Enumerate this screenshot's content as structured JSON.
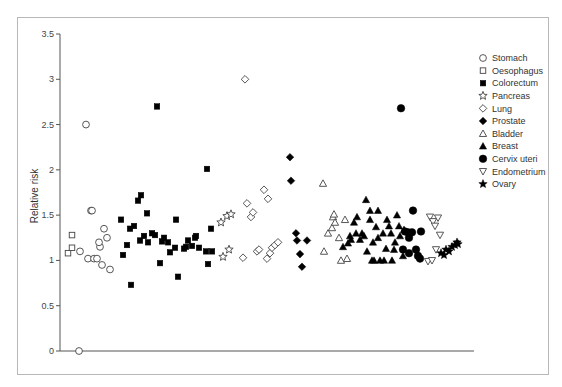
{
  "chart_data": {
    "type": "scatter",
    "title": "",
    "xlabel": "",
    "ylabel": "Relative risk",
    "ylim": [
      0,
      3.5
    ],
    "yticks": [
      0,
      0.5,
      1,
      1.5,
      2,
      2.5,
      3,
      3.5
    ],
    "ytick_labels": [
      "0",
      "0.5",
      "1",
      "1.5",
      "2",
      "2.5",
      "3",
      "3.5"
    ],
    "grid": false,
    "legend_position": "right",
    "series": [
      {
        "name": "Stomach",
        "marker": "circle-open",
        "x": [
          86,
          80,
          91,
          92,
          88,
          94,
          97,
          100,
          99,
          107,
          104,
          102,
          110,
          79
        ],
        "values": [
          2.5,
          1.1,
          1.55,
          1.55,
          1.02,
          1.02,
          1.02,
          1.15,
          1.2,
          1.25,
          1.35,
          0.95,
          0.9,
          0.0
        ]
      },
      {
        "name": "Oesophagus",
        "marker": "square-open",
        "x": [
          68,
          72,
          72
        ],
        "values": [
          1.08,
          1.14,
          1.28
        ]
      },
      {
        "name": "Colorectum",
        "marker": "square-filled",
        "x": [
          121,
          123,
          127,
          130,
          134,
          138,
          141,
          147,
          148,
          140,
          144,
          131,
          152,
          155,
          157,
          164,
          160,
          168,
          170,
          176,
          175,
          178,
          184,
          188,
          192,
          186,
          195,
          199,
          206,
          208,
          162,
          211,
          207,
          196,
          212
        ],
        "values": [
          1.45,
          1.06,
          1.17,
          1.35,
          1.38,
          1.66,
          1.72,
          1.52,
          1.2,
          1.22,
          1.27,
          0.73,
          1.3,
          1.28,
          2.7,
          1.25,
          0.97,
          1.2,
          1.09,
          1.45,
          1.14,
          0.82,
          1.13,
          1.22,
          1.16,
          1.15,
          1.25,
          1.14,
          1.1,
          0.96,
          1.21,
          1.35,
          2.01,
          1.27,
          1.1
        ]
      },
      {
        "name": "Pancreas",
        "marker": "star-open",
        "x": [
          221,
          223,
          227,
          229,
          231
        ],
        "values": [
          1.42,
          1.04,
          1.49,
          1.12,
          1.51
        ]
      },
      {
        "name": "Lung",
        "marker": "diamond-open",
        "x": [
          245,
          247,
          251,
          253,
          257,
          259,
          264,
          267,
          270,
          272,
          275,
          278,
          243,
          268
        ],
        "values": [
          3.0,
          1.63,
          1.48,
          1.53,
          1.1,
          1.12,
          1.78,
          1.02,
          1.08,
          1.14,
          1.17,
          1.2,
          1.03,
          1.68
        ]
      },
      {
        "name": "Prostate",
        "marker": "diamond-filled",
        "x": [
          290,
          291,
          296,
          297,
          300,
          302,
          307
        ],
        "values": [
          2.14,
          1.88,
          1.3,
          1.22,
          1.07,
          0.93,
          1.22
        ]
      },
      {
        "name": "Bladder",
        "marker": "triangle-open",
        "x": [
          323,
          324,
          328,
          332,
          333,
          335,
          339,
          334,
          345,
          347,
          341
        ],
        "values": [
          1.85,
          1.1,
          1.3,
          1.36,
          1.48,
          1.42,
          1.25,
          1.51,
          1.45,
          1.02,
          1.0
        ]
      },
      {
        "name": "Breast",
        "marker": "triangle-filled",
        "x": [
          343,
          348,
          351,
          354,
          357,
          360,
          362,
          366,
          367,
          370,
          372,
          373,
          376,
          378,
          380,
          383,
          387,
          389,
          391,
          392,
          394,
          397,
          400,
          403,
          404,
          350,
          356,
          364,
          370,
          374,
          378,
          384,
          386,
          395,
          399
        ],
        "values": [
          1.15,
          1.19,
          1.23,
          1.42,
          1.48,
          1.23,
          1.3,
          1.67,
          1.1,
          1.45,
          1.0,
          1.2,
          1.37,
          1.55,
          1.0,
          1.3,
          1.45,
          1.38,
          1.3,
          1.0,
          1.12,
          1.5,
          1.27,
          1.05,
          1.34,
          1.27,
          1.3,
          1.27,
          1.55,
          1.0,
          1.25,
          1.0,
          1.13,
          1.2,
          1.38
        ]
      },
      {
        "name": "Cervix uteri",
        "marker": "circle-filled",
        "x": [
          401,
          405,
          408,
          409,
          413,
          416,
          418,
          420,
          421,
          403,
          409,
          412
        ],
        "values": [
          2.68,
          1.32,
          1.31,
          1.25,
          1.55,
          1.12,
          1.05,
          1.02,
          1.32,
          1.12,
          1.08,
          1.31
        ]
      },
      {
        "name": "Endometrium",
        "marker": "triangle-down-open",
        "x": [
          430,
          433,
          435,
          438,
          440,
          436,
          428,
          432
        ],
        "values": [
          1.48,
          1.43,
          1.38,
          1.47,
          1.28,
          1.12,
          0.99,
          1.0
        ]
      },
      {
        "name": "Ovary",
        "marker": "star-filled",
        "x": [
          441,
          444,
          446,
          449,
          452,
          455,
          457,
          458
        ],
        "values": [
          1.08,
          1.06,
          1.12,
          1.1,
          1.15,
          1.17,
          1.2,
          1.18
        ]
      }
    ]
  },
  "legend": {
    "items": [
      {
        "label": "Stomach",
        "marker": "circle-open"
      },
      {
        "label": "Oesophagus",
        "marker": "square-open"
      },
      {
        "label": "Colorectum",
        "marker": "square-filled"
      },
      {
        "label": "Pancreas",
        "marker": "star-open"
      },
      {
        "label": "Lung",
        "marker": "diamond-open"
      },
      {
        "label": "Prostate",
        "marker": "diamond-filled"
      },
      {
        "label": "Bladder",
        "marker": "triangle-open"
      },
      {
        "label": "Breast",
        "marker": "triangle-filled"
      },
      {
        "label": "Cervix uteri",
        "marker": "circle-filled"
      },
      {
        "label": "Endometrium",
        "marker": "triangle-down-open"
      },
      {
        "label": "Ovary",
        "marker": "star-filled"
      }
    ]
  },
  "colors": {
    "marker": "#000000",
    "axis": "#555555",
    "frame": "#b8b8b8",
    "open_marker_stroke": "#444444"
  }
}
